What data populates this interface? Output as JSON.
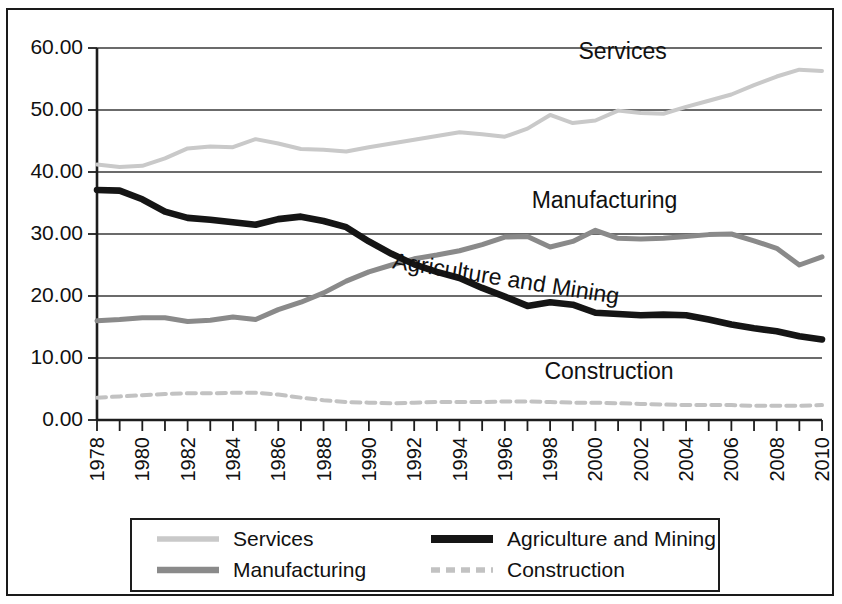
{
  "chart_data": {
    "type": "line",
    "title": "",
    "subtitle": "",
    "xlabel": "",
    "ylabel": "",
    "xlim": [
      1978,
      2010
    ],
    "ylim": [
      0,
      60
    ],
    "grid": true,
    "legend_position": "bottom",
    "x": [
      1978,
      1979,
      1980,
      1981,
      1982,
      1983,
      1984,
      1985,
      1986,
      1987,
      1988,
      1989,
      1990,
      1991,
      1992,
      1993,
      1994,
      1995,
      1996,
      1997,
      1998,
      1999,
      2000,
      2001,
      2002,
      2003,
      2004,
      2005,
      2006,
      2007,
      2008,
      2009,
      2010
    ],
    "x_tick_labels": [
      "1978",
      "1980",
      "1982",
      "1984",
      "1986",
      "1988",
      "1990",
      "1992",
      "1994",
      "1996",
      "1998",
      "2000",
      "2002",
      "2004",
      "2006",
      "2008",
      "2010"
    ],
    "y_tick_labels": [
      "0.00",
      "10.00",
      "20.00",
      "30.00",
      "40.00",
      "50.00",
      "60.00"
    ],
    "y_ticks": [
      0,
      10,
      20,
      30,
      40,
      50,
      60
    ],
    "series": [
      {
        "name": "Services",
        "color": "#c9c9c9",
        "style": "solid-thin-light",
        "values": [
          41.2,
          40.8,
          41.0,
          42.2,
          43.8,
          44.1,
          44.0,
          45.3,
          44.6,
          43.7,
          43.6,
          43.3,
          44.0,
          44.6,
          45.2,
          45.8,
          46.4,
          46.1,
          45.7,
          47.0,
          49.2,
          47.9,
          48.3,
          49.9,
          49.5,
          49.4,
          50.5,
          51.5,
          52.5,
          54.0,
          55.4,
          56.5,
          56.3
        ]
      },
      {
        "name": "Manufacturing",
        "color": "#8a8a8a",
        "style": "solid-medium-gray",
        "values": [
          16.0,
          16.2,
          16.5,
          16.5,
          15.9,
          16.1,
          16.6,
          16.2,
          17.8,
          19.0,
          20.5,
          22.4,
          23.9,
          25.0,
          26.0,
          26.6,
          27.3,
          28.3,
          29.5,
          29.6,
          27.9,
          28.8,
          30.6,
          29.3,
          29.2,
          29.3,
          29.6,
          29.9,
          30.0,
          28.9,
          27.7,
          25.0,
          26.3
        ]
      },
      {
        "name": "Agriculture and Mining",
        "color": "#151515",
        "style": "solid-thick-black",
        "values": [
          37.1,
          37.0,
          35.6,
          33.6,
          32.6,
          32.3,
          31.9,
          31.5,
          32.4,
          32.8,
          32.1,
          31.1,
          28.8,
          26.8,
          25.1,
          23.9,
          22.9,
          21.3,
          19.9,
          18.4,
          19.0,
          18.6,
          17.3,
          17.1,
          16.9,
          17.0,
          16.9,
          16.2,
          15.4,
          14.8,
          14.3,
          13.5,
          13.0
        ]
      },
      {
        "name": "Construction",
        "color": "#c2c2c2",
        "style": "dashed-light",
        "values": [
          3.6,
          3.8,
          4.0,
          4.2,
          4.3,
          4.3,
          4.4,
          4.4,
          4.1,
          3.6,
          3.2,
          2.9,
          2.8,
          2.7,
          2.8,
          2.9,
          2.9,
          2.9,
          3.0,
          3.0,
          2.9,
          2.8,
          2.8,
          2.7,
          2.6,
          2.5,
          2.4,
          2.4,
          2.4,
          2.3,
          2.3,
          2.3,
          2.4
        ]
      }
    ],
    "annotations": [
      {
        "text": "Services",
        "x": 2001.2,
        "y": 58.3,
        "rotate": 0
      },
      {
        "text": "Manufacturing",
        "x": 2000.4,
        "y": 34.2,
        "rotate": 0
      },
      {
        "text": "Agriculture and Mining",
        "x": 1996.0,
        "y": 21.6,
        "rotate": 9
      },
      {
        "text": "Construction",
        "x": 2000.6,
        "y": 6.6,
        "rotate": 0
      }
    ],
    "legend": [
      {
        "label": "Services",
        "color": "#c9c9c9",
        "style": "solid-thin-light"
      },
      {
        "label": "Agriculture and Mining",
        "color": "#151515",
        "style": "solid-thick-black"
      },
      {
        "label": "Manufacturing",
        "color": "#8a8a8a",
        "style": "solid-medium-gray"
      },
      {
        "label": "Construction",
        "color": "#c2c2c2",
        "style": "dashed-light"
      }
    ]
  }
}
